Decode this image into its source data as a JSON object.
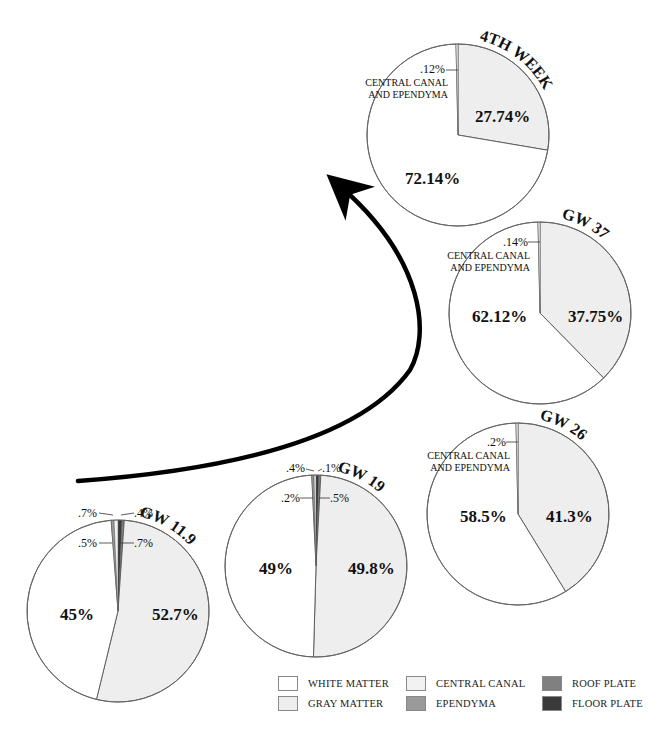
{
  "chart_data": {
    "type": "pie",
    "colors": {
      "white_matter": "#ffffff",
      "gray_matter": "#eeeeee",
      "central_canal": "#f2f2f2",
      "ependyma": "#9a9a9a",
      "roof_plate": "#808080",
      "floor_plate": "#3a3a3a",
      "outline": "#555555"
    },
    "legend": [
      {
        "key": "white_matter",
        "label": "WHITE MATTER"
      },
      {
        "key": "gray_matter",
        "label": "GRAY MATTER"
      },
      {
        "key": "central_canal",
        "label": "CENTRAL CANAL"
      },
      {
        "key": "ependyma",
        "label": "EPENDYMA"
      },
      {
        "key": "roof_plate",
        "label": "ROOF PLATE"
      },
      {
        "key": "floor_plate",
        "label": "FLOOR PLATE"
      }
    ],
    "pies": [
      {
        "title": "GW 11.9",
        "cx": 118,
        "cy": 611,
        "r": 91,
        "title_path_start": 168,
        "title_path_end": 196,
        "slices": [
          {
            "key": "gray_matter",
            "value": 52.7,
            "label": "52.7%"
          },
          {
            "key": "white_matter",
            "value": 45,
            "label": "45%"
          },
          {
            "key": "central_canal",
            "value": 0.7,
            "label": ".7%"
          },
          {
            "key": "ependyma",
            "value": 0.5,
            "label": ".5%"
          },
          {
            "key": "floor_plate",
            "value": 0.7,
            "label": ".7%"
          },
          {
            "key": "roof_plate",
            "value": 0.4,
            "label": ".4%"
          }
        ],
        "big_labels": [
          {
            "text": "52.7%",
            "x": 152,
            "y": 620
          },
          {
            "text": "45%",
            "x": 60,
            "y": 620
          }
        ],
        "small_labels": [
          {
            "text": ".7%",
            "x": 78,
            "y": 517,
            "line": [
              99,
              513,
              113,
              515
            ]
          },
          {
            "text": ".4%",
            "x": 134,
            "y": 517,
            "line": [
              121,
              515,
              134,
              513
            ]
          },
          {
            "text": ".5%",
            "x": 78,
            "y": 547,
            "line": [
              99,
              543,
              112,
              543
            ]
          },
          {
            "text": ".7%",
            "x": 134,
            "y": 547,
            "line": [
              121,
              543,
              134,
              543
            ]
          }
        ],
        "cc_label": false
      },
      {
        "title": "GW 19",
        "cx": 316,
        "cy": 566,
        "r": 91,
        "title_path_start": 355,
        "title_path_end": 395,
        "slices": [
          {
            "key": "gray_matter",
            "value": 49.8,
            "label": "49.8%"
          },
          {
            "key": "white_matter",
            "value": 49,
            "label": "49%"
          },
          {
            "key": "central_canal",
            "value": 0.2,
            "label": ".2%"
          },
          {
            "key": "ependyma",
            "value": 0.4,
            "label": ".4%"
          },
          {
            "key": "floor_plate",
            "value": 0.5,
            "label": ".5%"
          },
          {
            "key": "roof_plate",
            "value": 0.1,
            "label": ".1%"
          }
        ],
        "big_labels": [
          {
            "text": "49.8%",
            "x": 348,
            "y": 574
          },
          {
            "text": "49%",
            "x": 259,
            "y": 574
          }
        ],
        "small_labels": [
          {
            "text": ".4%",
            "x": 286,
            "y": 472,
            "line": [
              306,
              469,
              314,
              471
            ]
          },
          {
            "text": ".1%",
            "x": 322,
            "y": 472,
            "line": [
              318,
              471,
              322,
              469
            ]
          },
          {
            "text": ".2%",
            "x": 281,
            "y": 502,
            "line": [
              300,
              498,
              313,
              498
            ]
          },
          {
            "text": ".5%",
            "x": 330,
            "y": 502,
            "line": [
              319,
              498,
              330,
              498
            ]
          }
        ],
        "cc_label": false
      },
      {
        "title": "GW 26",
        "cx": 518,
        "cy": 514,
        "r": 91,
        "title_path_start": 555,
        "title_path_end": 600,
        "slices": [
          {
            "key": "gray_matter",
            "value": 41.3,
            "label": "41.3%"
          },
          {
            "key": "white_matter",
            "value": 58.5,
            "label": "58.5%"
          },
          {
            "key": "central_canal",
            "value": 0.2,
            "label": ".2%"
          }
        ],
        "big_labels": [
          {
            "text": "41.3%",
            "x": 546,
            "y": 522
          },
          {
            "text": "58.5%",
            "x": 460,
            "y": 522
          }
        ],
        "small_labels": [
          {
            "text": ".2%",
            "x": 487,
            "y": 446,
            "line": [
              506,
              442,
              518,
              442
            ]
          }
        ],
        "cc_label": true,
        "cc_label_lines": [
          "CENTRAL CANAL",
          "AND EPENDYMA"
        ],
        "cc_label_x": 510,
        "cc_label_y": 459
      },
      {
        "title": "GW 37",
        "cx": 540,
        "cy": 313,
        "r": 91,
        "title_path_start": 577,
        "title_path_end": 622,
        "slices": [
          {
            "key": "gray_matter",
            "value": 37.75,
            "label": "37.75%"
          },
          {
            "key": "white_matter",
            "value": 62.12,
            "label": "62.12%"
          },
          {
            "key": "central_canal",
            "value": 0.14,
            "label": ".14%"
          }
        ],
        "big_labels": [
          {
            "text": "37.75%",
            "x": 568,
            "y": 322
          },
          {
            "text": "62.12%",
            "x": 472,
            "y": 322
          }
        ],
        "small_labels": [
          {
            "text": ".14%",
            "x": 503,
            "y": 246,
            "line": [
              528,
              242,
              540,
              242
            ]
          }
        ],
        "cc_label": true,
        "cc_label_lines": [
          "CENTRAL CANAL",
          "AND EPENDYMA"
        ],
        "cc_label_x": 530,
        "cc_label_y": 259
      },
      {
        "title": "4TH WEEK",
        "cx": 458,
        "cy": 135,
        "r": 91,
        "title_path_start": 495,
        "title_path_end": 560,
        "slices": [
          {
            "key": "gray_matter",
            "value": 27.74,
            "label": "27.74%"
          },
          {
            "key": "white_matter",
            "value": 72.14,
            "label": "72.14%"
          },
          {
            "key": "central_canal",
            "value": 0.12,
            "label": ".12%"
          }
        ],
        "big_labels": [
          {
            "text": "27.74%",
            "x": 475,
            "y": 122
          },
          {
            "text": "72.14%",
            "x": 405,
            "y": 184
          }
        ],
        "small_labels": [
          {
            "text": ".12%",
            "x": 420,
            "y": 73,
            "line": [
              446,
              70,
              458,
              70
            ]
          }
        ],
        "cc_label": true,
        "cc_label_lines": [
          "CENTRAL CANAL",
          "AND EPENDYMA"
        ],
        "cc_label_x": 448,
        "cc_label_y": 86
      }
    ],
    "arrow": {
      "from": "GW 11.9",
      "to": "4TH WEEK",
      "path": "M 78 481 C 230 470, 360 440, 410 370 C 430 335, 425 260, 340 186"
    }
  }
}
